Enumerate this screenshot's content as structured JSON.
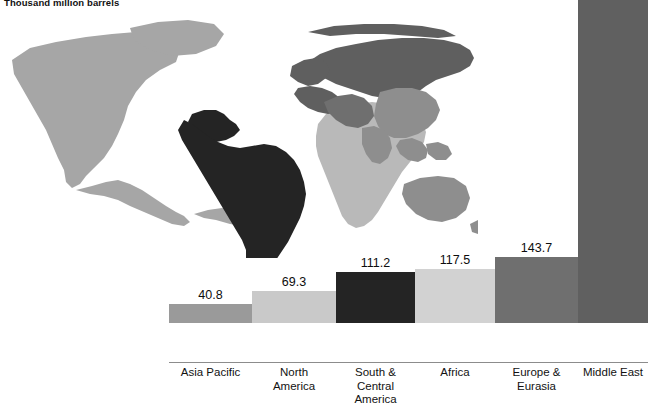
{
  "chart_data": {
    "type": "bar",
    "title": "Thousand million barrels",
    "subtitle": "",
    "xlabel": "",
    "ylabel": "",
    "ylim": [
      0,
      800
    ],
    "grid": false,
    "legend": "none",
    "value_labels_shown": true,
    "categories": [
      "Asia Pacific",
      "North America",
      "South & Central America",
      "Africa",
      "Europe & Eurasia",
      "Middle East"
    ],
    "category_lines": [
      [
        "Asia Pacific"
      ],
      [
        "North",
        "America"
      ],
      [
        "South &",
        "Central America"
      ],
      [
        "Africa"
      ],
      [
        "Europe &",
        "Eurasia"
      ],
      [
        "Middle East"
      ]
    ],
    "values": [
      40.8,
      69.3,
      111.2,
      117.5,
      143.7,
      755.3
    ],
    "value_text": [
      "40.8",
      "69.3",
      "111.2",
      "117.5",
      "143.7",
      "755.3"
    ],
    "colors": [
      "#9a9a9a",
      "#c9c9c9",
      "#242424",
      "#d2d2d2",
      "#6f6f6f",
      "#606060"
    ]
  },
  "map": {
    "name": "world-map",
    "region_colors": {
      "north_america": "#a6a6a6",
      "south_central_america": "#242424",
      "africa": "#b9b9b9",
      "europe_eurasia": "#5f5f5f",
      "middle_east": "#6f6f6f",
      "asia_pacific": "#8e8e8e"
    }
  }
}
